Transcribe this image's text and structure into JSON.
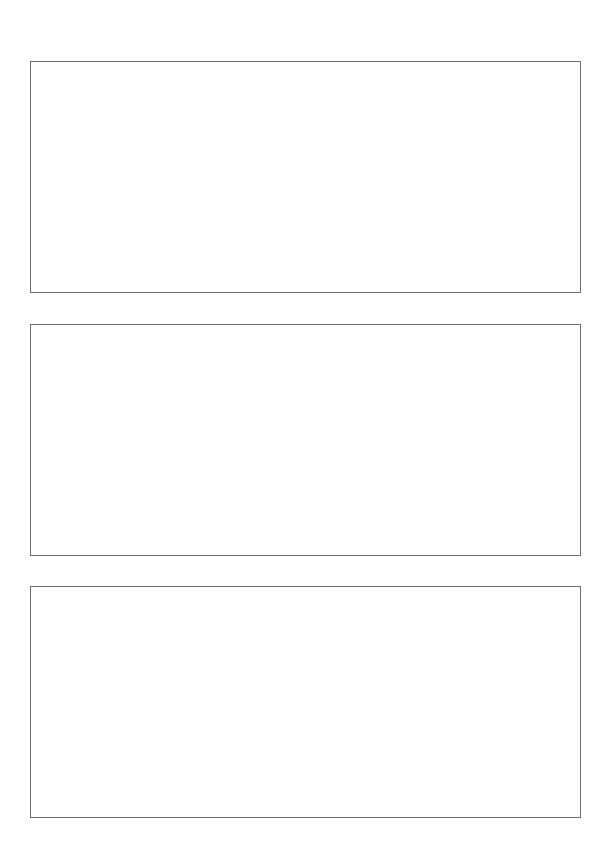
{
  "page": {
    "background_color": "#ffffff",
    "border_color": "#6e6e6e",
    "frames": [
      {
        "content": ""
      },
      {
        "content": ""
      },
      {
        "content": ""
      }
    ]
  }
}
